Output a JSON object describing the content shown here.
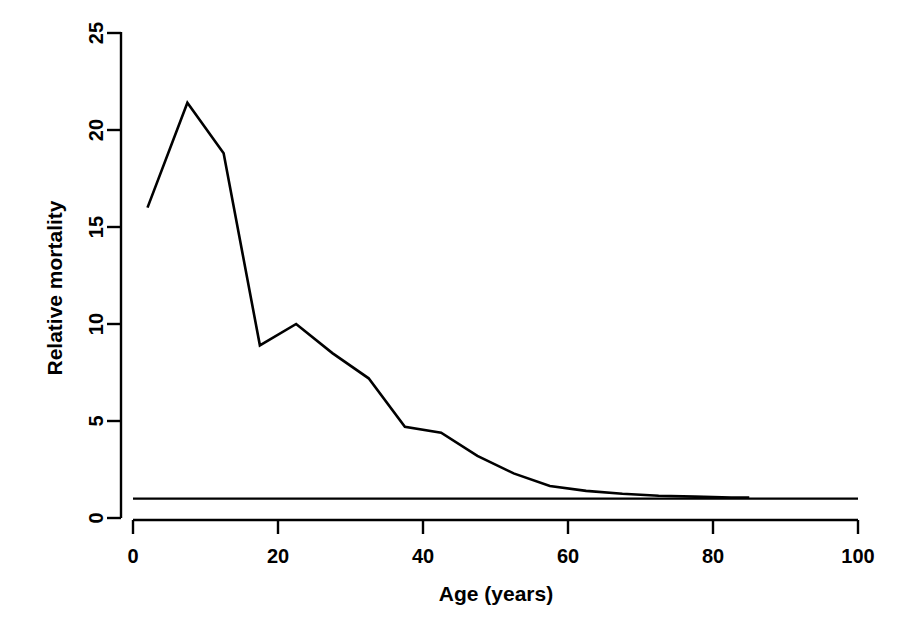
{
  "chart_data": {
    "type": "line",
    "title": "",
    "xlabel": "Age (years)",
    "ylabel": "Relative mortality",
    "xlim": [
      0,
      100
    ],
    "ylim": [
      0,
      25
    ],
    "xticks": [
      0,
      20,
      40,
      60,
      80,
      100
    ],
    "yticks": [
      0,
      5,
      10,
      15,
      20,
      25
    ],
    "grid": false,
    "legend": "none",
    "series": [
      {
        "name": "Relative mortality",
        "x": [
          2,
          7.5,
          12.5,
          17.5,
          22.5,
          27.5,
          32.5,
          37.5,
          42.5,
          47.5,
          52.5,
          57.5,
          62.5,
          67.5,
          72.5,
          77.5,
          82.5,
          85
        ],
        "values": [
          16.0,
          21.4,
          18.8,
          8.9,
          10.0,
          8.5,
          7.2,
          4.7,
          4.4,
          3.2,
          2.3,
          1.65,
          1.4,
          1.25,
          1.15,
          1.1,
          1.05,
          1.05
        ]
      },
      {
        "name": "reference",
        "x": [
          0,
          100
        ],
        "values": [
          1.0,
          1.0
        ]
      }
    ],
    "annotations": []
  },
  "axes": {
    "x_title": "Age (years)",
    "y_title": "Relative mortality",
    "x_tick_labels": [
      "0",
      "20",
      "40",
      "60",
      "80",
      "100"
    ],
    "y_tick_labels": [
      "0",
      "5",
      "10",
      "15",
      "20",
      "25"
    ]
  },
  "style": {
    "line_color": "#000000",
    "axis_color": "#000000",
    "background": "#ffffff"
  }
}
